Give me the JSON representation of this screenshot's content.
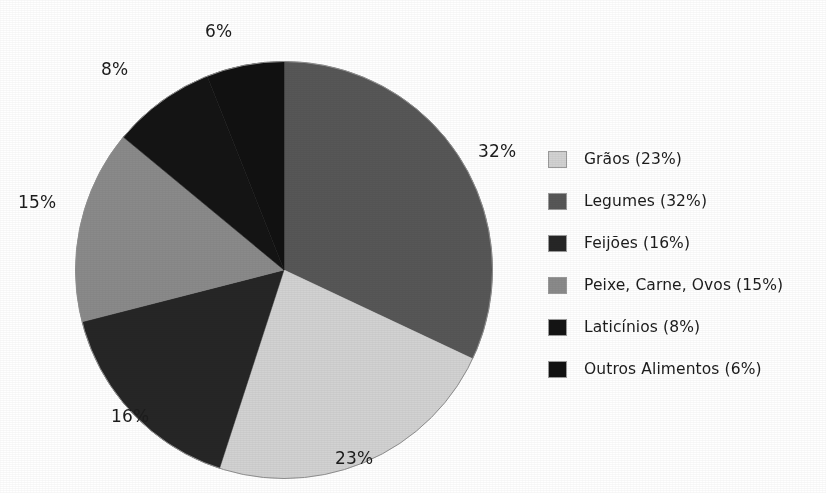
{
  "figure": {
    "title_fragment": "",
    "background": "#ffffff"
  },
  "chart_data": {
    "type": "pie",
    "title": "",
    "xlabel": "",
    "ylabel": "",
    "legend_position": "right",
    "grid": false,
    "start_angle_deg": 0,
    "direction": "clockwise",
    "units": "percent",
    "total": 100,
    "categories": [
      "Grãos",
      "Legumes",
      "Feijões",
      "Peixe, Carne, Ovos",
      "Laticínios",
      "Outros Alimentos"
    ],
    "values": [
      23,
      32,
      16,
      15,
      8,
      6
    ],
    "colors": [
      "#d2d2d2",
      "#575757",
      "#262626",
      "#8a8a8a",
      "#141414",
      "#111111"
    ],
    "slice_order_clockwise_from_top": [
      "Legumes",
      "Grãos",
      "Feijões",
      "Peixe, Carne, Ovos",
      "Laticínios",
      "Outros Alimentos"
    ],
    "slices": [
      {
        "label": "Legumes",
        "value": 32,
        "pct_label": "32%",
        "color": "#575757"
      },
      {
        "label": "Grãos",
        "value": 23,
        "pct_label": "23%",
        "color": "#d2d2d2"
      },
      {
        "label": "Feijões",
        "value": 16,
        "pct_label": "16%",
        "color": "#262626"
      },
      {
        "label": "Peixe, Carne, Ovos",
        "value": 15,
        "pct_label": "15%",
        "color": "#8a8a8a"
      },
      {
        "label": "Laticínios",
        "value": 8,
        "pct_label": "8%",
        "color": "#141414"
      },
      {
        "label": "Outros Alimentos",
        "value": 6,
        "pct_label": "6%",
        "color": "#111111"
      }
    ]
  },
  "pie_labels": {
    "legumes": "32%",
    "graos": "23%",
    "feijoes": "16%",
    "peixe": "15%",
    "laticinios": "8%",
    "outros": "6%"
  },
  "legend": {
    "items": [
      {
        "label": "Grãos (23%)",
        "color": "#d2d2d2"
      },
      {
        "label": "Legumes (32%)",
        "color": "#575757"
      },
      {
        "label": "Feijões (16%)",
        "color": "#262626"
      },
      {
        "label": "Peixe, Carne, Ovos (15%)",
        "color": "#8a8a8a"
      },
      {
        "label": "Laticínios (8%)",
        "color": "#141414"
      },
      {
        "label": "Outros Alimentos (6%)",
        "color": "#111111"
      }
    ]
  }
}
